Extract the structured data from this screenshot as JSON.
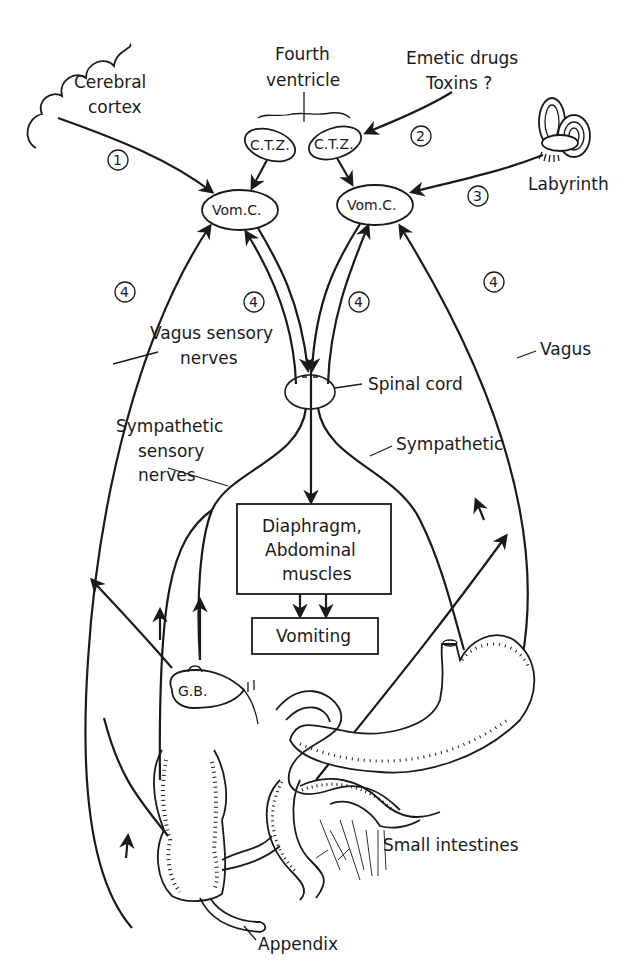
{
  "diagram": {
    "nodes": {
      "cerebral_cortex": "Cerebral cortex",
      "cerebral_cortex_line1": "Cerebral",
      "cerebral_cortex_line2": "cortex",
      "fourth_ventricle_line1": "Fourth",
      "fourth_ventricle_line2": "ventricle",
      "emetic_line1": "Emetic drugs",
      "emetic_line2": "Toxins ?",
      "ctz_left": "C.T.Z.",
      "ctz_right": "C.T.Z.",
      "vomc_left": "Vom.C.",
      "vomc_right": "Vom.C.",
      "labyrinth": "Labyrinth",
      "vagus_sensory_line1": "Vagus sensory",
      "vagus_sensory_line2": "nerves",
      "spinal_cord": "Spinal cord",
      "vagus": "Vagus",
      "sympathetic_sensory_line1": "Sympathetic",
      "sympathetic_sensory_line2": "sensory",
      "sympathetic_sensory_line3": "nerves",
      "sympathetic": "Sympathetic",
      "effector_line1": "Diaphragm,",
      "effector_line2": "Abdominal",
      "effector_line3": "muscles",
      "vomiting": "Vomiting",
      "gall_bladder": "G.B.",
      "small_intestines": "Small intestines",
      "appendix": "Appendix"
    },
    "pathway_numbers": {
      "p1": "1",
      "p2": "2",
      "p3": "3",
      "p4a": "4",
      "p4b": "4",
      "p4c": "4",
      "p4d": "4"
    },
    "edges": [
      {
        "from": "Cerebral cortex",
        "to": "Vom.C. (left)",
        "label": "1"
      },
      {
        "from": "Emetic drugs / Toxins ?",
        "to": "C.T.Z. (right)",
        "label": "2"
      },
      {
        "from": "C.T.Z.",
        "to": "Vom.C."
      },
      {
        "from": "Labyrinth",
        "to": "Vom.C. (right)",
        "label": "3"
      },
      {
        "from": "Vagus sensory nerves",
        "to": "Vom.C.",
        "label": "4"
      },
      {
        "from": "Sympathetic sensory nerves",
        "to": "Vom.C.",
        "label": "4"
      },
      {
        "from": "Vom.C.",
        "to": "Spinal cord"
      },
      {
        "from": "Spinal cord",
        "to": "Diaphragm, Abdominal muscles"
      },
      {
        "from": "Diaphragm, Abdominal muscles",
        "to": "Vomiting"
      }
    ],
    "colors": {
      "ink": "#1a1a1a",
      "paper": "#ffffff"
    }
  }
}
